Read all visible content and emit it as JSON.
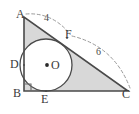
{
  "figure": {
    "kind": "geometry-diagram",
    "colors": {
      "stroke": "#4a4a4a",
      "shade_fill": "#d8d8d8",
      "circle_fill": "#ffffff",
      "dash_stroke": "#9a9a9a",
      "label_text": "#3a3a3a"
    },
    "vertices": [
      {
        "name": "A",
        "label": "A"
      },
      {
        "name": "B",
        "label": "B"
      },
      {
        "name": "C",
        "label": "C"
      }
    ],
    "tangent_points": [
      {
        "name": "D",
        "label": "D"
      },
      {
        "name": "E",
        "label": "E"
      },
      {
        "name": "F",
        "label": "F"
      }
    ],
    "center": {
      "name": "O",
      "label": "O"
    },
    "measure_labels": [
      {
        "name": "AF",
        "label": "4"
      },
      {
        "name": "FC",
        "label": "6"
      }
    ],
    "right_angle_at": "B"
  }
}
